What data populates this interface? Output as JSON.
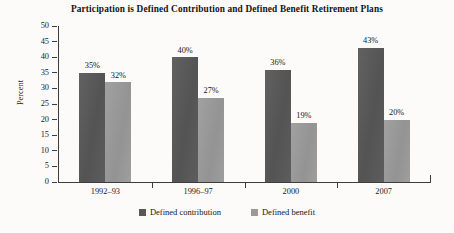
{
  "chart_data": {
    "type": "bar",
    "title": "Participation is Defined Contribution and Defined Benefit Retirement Plans",
    "xlabel": "",
    "ylabel": "Percent",
    "ylim": [
      0,
      50
    ],
    "ytick_step": 5,
    "yticks": [
      "50",
      "45",
      "40",
      "35",
      "30",
      "25",
      "20",
      "15",
      "10",
      "5",
      "0"
    ],
    "grid": false,
    "legend_position": "bottom",
    "categories": [
      "1992–93",
      "1996–97",
      "2000",
      "2007"
    ],
    "series": [
      {
        "name": "Defined contribution",
        "color": "#585858",
        "values": [
          35,
          40,
          36,
          43
        ],
        "labels": [
          "35%",
          "40%",
          "36%",
          "43%"
        ]
      },
      {
        "name": "Defined benefit",
        "color": "#9a9a9a",
        "values": [
          32,
          27,
          19,
          20
        ],
        "labels": [
          "32%",
          "27%",
          "19%",
          "20%"
        ]
      }
    ],
    "value_label_suffix": "%"
  },
  "legend": {
    "items": [
      {
        "label": "Defined contribution",
        "swatch": "dc"
      },
      {
        "label": "Defined benefit",
        "swatch": "db"
      }
    ]
  }
}
